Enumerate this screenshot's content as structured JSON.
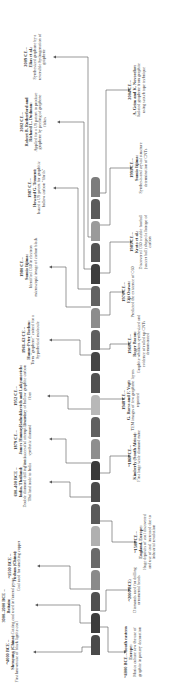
{
  "bar": {
    "segment_colors": [
      "#4a4a4a",
      "#3c3c3c",
      "#505050",
      "#8a8a8a",
      "#6a6a6a",
      "#b0b0b0",
      "#5a5a5a",
      "#4a4a4a",
      "#3a3a3a",
      "#8e8e8e",
      "#606060",
      "#b8b8b8",
      "#505050",
      "#454545",
      "#5e5e5e",
      "#8c8c8c",
      "#626262",
      "#3e3e3e",
      "#525252",
      "#9a9a9a",
      "#5a5a5a",
      "#7c7c7c"
    ]
  },
  "events_top": [
    {
      "date": "~4000 BCE –",
      "who": "Shenyang (China):",
      "desc": "First known use of black lignite coal"
    },
    {
      "date": "3000–2000 BCE –",
      "who": "Britain:",
      "desc": "Cutting coal used in funeral pyres"
    },
    {
      "date": "~1500 BCE –",
      "who": "Fushun (China):",
      "desc": "Coal used for smelting copper"
    },
    {
      "date": "600–400 BCE –",
      "who": "India, Thailand:",
      "desc": "Double diamond drilling used. Thailand trade to India"
    },
    {
      "date": "1879 CE –",
      "who": "James Hannay:",
      "desc": "First successful attempt towards synthetic diamond"
    },
    {
      "date": "1952 CE –",
      "who": "Radushkevich and Lukyanovich:",
      "desc": "Discovery of hollow graphite carbon fiber"
    },
    {
      "date": "1961–62 CE –",
      "who": "Hanns-Peter Boehm:",
      "desc": "Term \"graphene\" coined for a hypothetical molecule"
    },
    {
      "date": "1980 CE –",
      "who": "Sumio Iijima:",
      "desc": "Identified C60 in electron microscopic image of carbon black"
    },
    {
      "date": "1987 CE –",
      "who": "Howard G. Tennent:",
      "desc": "Issued a US patent for graphitic hollow carbon \"fibrils\""
    },
    {
      "date": "2002 CE –",
      "who": "Robert B. Rutherford and Richard L. Dudman:",
      "desc": "Applied for a US patent to produce graphene by peeling of graphene flakes"
    },
    {
      "date": "2009 CE –",
      "who": "Elias et al.:",
      "desc": "Synthesized graphane by a reversible hydrogenation of graphene"
    }
  ],
  "events_bottom": [
    {
      "date": "~4000 BCE – South eastern Europe:",
      "who": "",
      "desc": "Marica culture saw the use of graphite in pottery decoration"
    },
    {
      "date": "~2000 BCE:",
      "who": "",
      "desc": "Diamonds used for drilling ornamental beads"
    },
    {
      "date": "~1500 CE –",
      "who": "England, Europe:",
      "desc": "Huge deposits of coal discovered and use of coal increased due to industrial revolution"
    },
    {
      "date": "~1860 CE –",
      "who": "Kimberly (South Africa):",
      "desc": "First large scale diamond mine"
    },
    {
      "date": "1948 CE –",
      "who": "G. Ruess and F. Vogt:",
      "desc": "TEM images of few graphene layers reported"
    },
    {
      "date": "1960 CE –",
      "who": "Roger Bacon:",
      "desc": "Graphite whiskers synthesized and evidence of rolled up CNTs demonstrated"
    },
    {
      "date": "1970 CE –",
      "who": "Eiji Osawa:",
      "desc": "Predicted the existence of C60"
    },
    {
      "date": "1985 CE –",
      "who": "Kroto et al.:",
      "desc": "Discovered C60 a stable football (soccer ball) shaped allotrope of carbon"
    },
    {
      "date": "1991 CE –",
      "who": "Sumio Iijima:",
      "desc": "Synthesis and crystal structure determination of CNTs"
    },
    {
      "date": "2004 CE –",
      "who": "A. Geim and K. Novoselov:",
      "desc": "Isolated graphene from graphite using scotch tape technique"
    }
  ]
}
